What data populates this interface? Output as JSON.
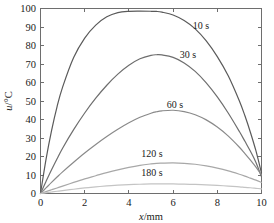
{
  "chart_data": {
    "type": "line",
    "title": "",
    "subtitle": "",
    "xlabel": "x/mm",
    "ylabel": "u/°C",
    "xlabel_var": "x",
    "xlabel_unit": "/mm",
    "ylabel_var": "u",
    "ylabel_unit": "/°C",
    "xlim": [
      0,
      10
    ],
    "ylim": [
      0,
      100
    ],
    "xticks": [
      0,
      2,
      4,
      6,
      8,
      10
    ],
    "yticks": [
      0,
      10,
      20,
      30,
      40,
      50,
      60,
      70,
      80,
      90,
      100
    ],
    "xtick_labels": [
      "0",
      "2",
      "4",
      "6",
      "8",
      "10"
    ],
    "ytick_labels": [
      "0",
      "10",
      "20",
      "30",
      "40",
      "50",
      "60",
      "70",
      "80",
      "90",
      "100"
    ],
    "grid": false,
    "legend_position": "inline-annotations",
    "x": [
      0,
      0.25,
      0.5,
      0.75,
      1,
      1.5,
      2,
      2.5,
      3,
      3.5,
      4,
      4.5,
      5,
      5.25,
      5.5,
      6,
      6.5,
      7,
      7.5,
      8,
      8.5,
      9,
      9.25,
      9.5,
      9.75,
      10
    ],
    "series": [
      {
        "name": "10 s",
        "label": "10 s",
        "color": "#5a5a5a",
        "width": 1.2,
        "peak_x": 5.3,
        "peak_y": 98.5,
        "values": [
          0,
          18.5,
          34.0,
          47.0,
          57.5,
          73.5,
          84.0,
          91.0,
          95.5,
          97.8,
          98.5,
          98.6,
          98.5,
          98.4,
          98.0,
          96.5,
          93.5,
          89.0,
          82.5,
          74.0,
          63.5,
          50.0,
          42.0,
          33.0,
          23.0,
          11.0
        ]
      },
      {
        "name": "30 s",
        "label": "30 s",
        "color": "#6e6e6e",
        "width": 1.2,
        "peak_x": 5.3,
        "peak_y": 75.0,
        "values": [
          0,
          6.5,
          12.8,
          18.8,
          24.5,
          34.5,
          43.5,
          51.5,
          58.5,
          64.5,
          69.3,
          72.8,
          74.7,
          75.0,
          74.9,
          73.6,
          70.6,
          66.0,
          59.8,
          52.2,
          43.4,
          33.5,
          28.2,
          22.8,
          16.8,
          9.0
        ]
      },
      {
        "name": "60 s",
        "label": "60 s",
        "color": "#8a8a8a",
        "width": 1.2,
        "peak_x": 5.2,
        "peak_y": 45.0,
        "values": [
          0,
          3.0,
          6.0,
          8.9,
          11.7,
          16.9,
          21.9,
          26.5,
          30.8,
          34.7,
          38.2,
          41.2,
          43.4,
          44.2,
          44.7,
          45.0,
          44.3,
          42.6,
          39.8,
          35.9,
          31.0,
          25.0,
          21.6,
          18.0,
          14.2,
          10.0
        ]
      },
      {
        "name": "120 s",
        "label": "120 s",
        "color": "#a8a8a8",
        "width": 1.2,
        "peak_x": 5.2,
        "peak_y": 16.5,
        "values": [
          0,
          1.0,
          2.0,
          3.0,
          4.0,
          6.0,
          7.9,
          9.6,
          11.3,
          12.8,
          14.1,
          15.2,
          16.0,
          16.3,
          16.4,
          16.5,
          16.3,
          15.8,
          14.9,
          13.7,
          12.2,
          10.4,
          9.4,
          8.3,
          7.2,
          6.0
        ]
      },
      {
        "name": "180 s",
        "label": "180 s",
        "color": "#c4c4c4",
        "width": 1.2,
        "peak_x": 5.2,
        "peak_y": 5.2,
        "values": [
          0,
          0.4,
          0.8,
          1.2,
          1.6,
          2.3,
          3.0,
          3.6,
          4.1,
          4.5,
          4.8,
          5.0,
          5.15,
          5.2,
          5.2,
          5.15,
          5.05,
          4.9,
          4.7,
          4.4,
          4.0,
          3.6,
          3.3,
          3.1,
          2.8,
          2.5
        ]
      }
    ],
    "annotations": [
      {
        "text": "10 s",
        "x_px": 201,
        "y_px": 29,
        "for_series": "10 s"
      },
      {
        "text": "30 s",
        "x_px": 188,
        "y_px": 58,
        "for_series": "30 s"
      },
      {
        "text": "60 s",
        "x_px": 175,
        "y_px": 108,
        "for_series": "60 s"
      },
      {
        "text": "120 s",
        "x_px": 152,
        "y_px": 157,
        "for_series": "120 s"
      },
      {
        "text": "180 s",
        "x_px": 152,
        "y_px": 176,
        "for_series": "180 s"
      }
    ],
    "axis_color": "#6e6e6e",
    "text_color": "#1a1a1a",
    "background": "#ffffff"
  }
}
